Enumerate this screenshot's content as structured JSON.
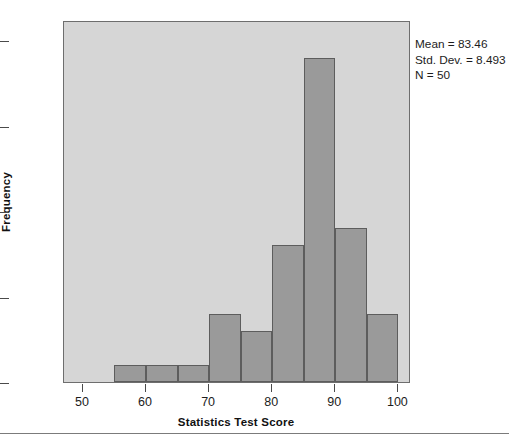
{
  "chart_data": {
    "type": "bar",
    "subtype": "histogram",
    "title": "",
    "xlabel": "Statistics Test Score",
    "ylabel": "Frequency",
    "xlim": [
      47,
      102
    ],
    "ylim": [
      0,
      21.2
    ],
    "grid": false,
    "legend": null,
    "bin_width": 5,
    "bin_edges": [
      55,
      60,
      65,
      70,
      75,
      80,
      85,
      90,
      95,
      100
    ],
    "categories": [
      "55-60",
      "60-65",
      "65-70",
      "70-75",
      "75-80",
      "80-85",
      "85-90",
      "90-95",
      "95-100"
    ],
    "values": [
      1,
      1,
      1,
      4,
      3,
      8,
      19,
      9,
      4
    ],
    "bars": [
      {
        "start": 55,
        "end": 60,
        "value": 1
      },
      {
        "start": 60,
        "end": 65,
        "value": 1
      },
      {
        "start": 65,
        "end": 70,
        "value": 1
      },
      {
        "start": 70,
        "end": 75,
        "value": 4
      },
      {
        "start": 75,
        "end": 80,
        "value": 3
      },
      {
        "start": 80,
        "end": 85,
        "value": 8
      },
      {
        "start": 85,
        "end": 90,
        "value": 19
      },
      {
        "start": 90,
        "end": 95,
        "value": 9
      },
      {
        "start": 95,
        "end": 100,
        "value": 4
      }
    ],
    "xticks": [
      50,
      60,
      70,
      80,
      90,
      100
    ],
    "xtick_labels": [
      "50",
      "60",
      "70",
      "80",
      "90",
      "100"
    ],
    "yticks": [
      0,
      5,
      10,
      15,
      20
    ],
    "ytick_labels": [
      "0",
      "5",
      "10",
      "15",
      "20"
    ],
    "annotations": [
      "Mean = 83.46",
      "Std. Dev. = 8.493",
      "N = 50"
    ],
    "colors": {
      "bar_fill": "#9a9a9a",
      "bar_edge": "#5d5d5d",
      "plot_background": "#d6d6d6",
      "frame": "#6e6e6e",
      "text": "#1c1c1c",
      "figure_background": "#ffffff"
    }
  }
}
